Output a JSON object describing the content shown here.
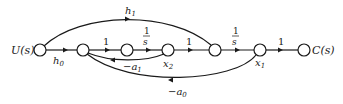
{
  "diagram": {
    "type": "signal-flow-graph",
    "nodes": [
      {
        "id": "U",
        "label": "U(s)",
        "x": 40,
        "y": 50
      },
      {
        "id": "n1",
        "label": "",
        "x": 83,
        "y": 50
      },
      {
        "id": "n2",
        "label": "",
        "x": 127,
        "y": 50
      },
      {
        "id": "x2",
        "label": "x2",
        "x": 168,
        "y": 50
      },
      {
        "id": "n4",
        "label": "",
        "x": 215,
        "y": 50
      },
      {
        "id": "x1",
        "label": "x1",
        "x": 260,
        "y": 50
      },
      {
        "id": "C",
        "label": "C(s)",
        "x": 304,
        "y": 50
      }
    ],
    "edges": [
      {
        "from": "U",
        "to": "n1",
        "gain": "h0"
      },
      {
        "from": "n1",
        "to": "n2",
        "gain": "1"
      },
      {
        "from": "n2",
        "to": "x2",
        "gain": "1/s"
      },
      {
        "from": "x2",
        "to": "n4",
        "gain": "1"
      },
      {
        "from": "n4",
        "to": "x1",
        "gain": "1/s"
      },
      {
        "from": "x1",
        "to": "C",
        "gain": "1"
      },
      {
        "from": "U",
        "to": "n4",
        "gain": "h1"
      },
      {
        "from": "x2",
        "to": "n1",
        "gain": "-a1"
      },
      {
        "from": "x1",
        "to": "n1",
        "gain": "-a0"
      }
    ]
  },
  "labels": {
    "input": "U(s)",
    "output": "C(s)",
    "h0": "h",
    "h0_sub": "0",
    "h1": "h",
    "h1_sub": "1",
    "gain_one": "1",
    "frac_num": "1",
    "frac_den": "s",
    "a1": "−a",
    "a1_sub": "1",
    "a0": "−a",
    "a0_sub": "0",
    "x2": "x",
    "x2_sub": "2",
    "x1": "x",
    "x1_sub": "1"
  }
}
